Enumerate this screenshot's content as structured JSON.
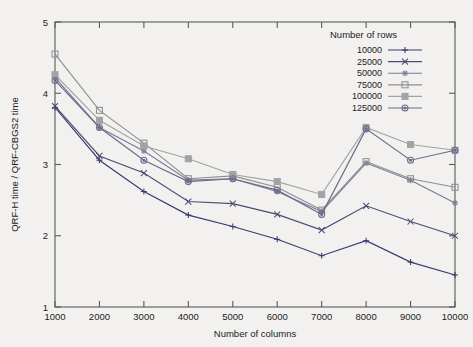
{
  "chart_data": {
    "type": "line",
    "title": "",
    "xlabel": "Number of columns",
    "ylabel": "QRF-H time / QRF-CBGS2 time",
    "x": [
      1000,
      2000,
      3000,
      4000,
      5000,
      6000,
      7000,
      8000,
      9000,
      10000
    ],
    "xlim": [
      1000,
      10000
    ],
    "ylim": [
      1,
      5
    ],
    "xticks": [
      "1000",
      "2000",
      "3000",
      "4000",
      "5000",
      "6000",
      "7000",
      "8000",
      "9000",
      "10000"
    ],
    "yticks": [
      "1",
      "2",
      "3",
      "4",
      "5"
    ],
    "grid": false,
    "legend_position": "top-right",
    "legend_title": "Number of rows",
    "series": [
      {
        "name": "10000",
        "marker": "plus",
        "color": "#3a3a6e",
        "values": [
          3.8,
          3.06,
          2.62,
          2.29,
          2.13,
          1.95,
          1.72,
          1.93,
          1.63,
          1.45
        ]
      },
      {
        "name": "25000",
        "marker": "cross",
        "color": "#4b4b78",
        "values": [
          3.82,
          3.12,
          2.88,
          2.48,
          2.45,
          2.3,
          2.08,
          2.42,
          2.2,
          2.0
        ]
      },
      {
        "name": "50000",
        "marker": "star",
        "color": "#7a7a9a",
        "values": [
          4.22,
          3.52,
          3.19,
          2.78,
          2.8,
          2.62,
          2.34,
          3.02,
          2.78,
          2.46
        ]
      },
      {
        "name": "75000",
        "marker": "square-open",
        "color": "#8f8f8f",
        "values": [
          4.55,
          3.76,
          3.3,
          2.8,
          2.84,
          2.68,
          2.36,
          3.04,
          2.8,
          2.68
        ]
      },
      {
        "name": "100000",
        "marker": "square-filled",
        "color": "#a3a3a3",
        "values": [
          4.26,
          3.62,
          3.26,
          3.08,
          2.86,
          2.76,
          2.58,
          3.52,
          3.28,
          3.2
        ]
      },
      {
        "name": "125000",
        "marker": "circle",
        "color": "#6b6b8a",
        "values": [
          4.18,
          3.52,
          3.06,
          2.76,
          2.8,
          2.64,
          2.3,
          3.5,
          3.06,
          3.2
        ]
      }
    ]
  }
}
